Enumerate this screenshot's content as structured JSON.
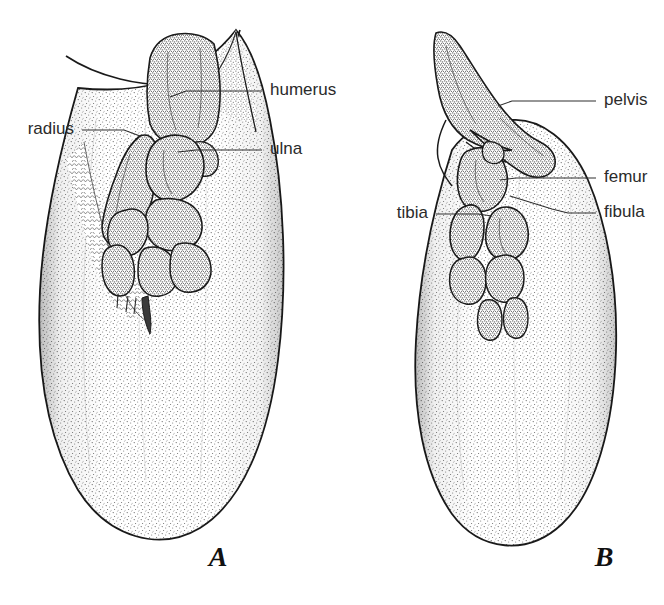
{
  "figure": {
    "background_color": "#ffffff",
    "ink_color": "#1a1a1a",
    "label_color": "#2b2b2b",
    "width": 664,
    "height": 605
  },
  "panels": [
    {
      "id": "A",
      "caption": "A",
      "caption_x": 218,
      "caption_y": 566,
      "description": "Front flipper with forelimb skeleton",
      "labels": [
        {
          "key": "humerus",
          "text": "humerus",
          "text_x": 270,
          "text_y": 91,
          "anchor": "start",
          "leader": "M 262 91 L 186 91 L 170 97"
        },
        {
          "key": "radius",
          "text": "radius",
          "text_x": 74,
          "text_y": 130,
          "anchor": "end",
          "leader": "M 82 130 L 124 130 L 140 136"
        },
        {
          "key": "ulna",
          "text": "ulna",
          "text_x": 270,
          "text_y": 150,
          "anchor": "start",
          "leader": "M 262 150 L 196 150 L 178 152"
        }
      ]
    },
    {
      "id": "B",
      "caption": "B",
      "caption_x": 604,
      "caption_y": 566,
      "description": "Hind flipper with hindlimb skeleton",
      "labels": [
        {
          "key": "pelvis",
          "text": "pelvis",
          "text_x": 604,
          "text_y": 101,
          "anchor": "start",
          "leader": "M 596 101 L 512 101 L 498 106"
        },
        {
          "key": "femur",
          "text": "femur",
          "text_x": 604,
          "text_y": 178,
          "anchor": "start",
          "leader": "M 596 178 L 516 178 L 500 180"
        },
        {
          "key": "fibula",
          "text": "fibula",
          "text_x": 604,
          "text_y": 213,
          "anchor": "start",
          "leader": "M 596 213 L 568 213 L 552 209 L 510 196"
        },
        {
          "key": "tibia",
          "text": "tibia",
          "text_x": 428,
          "text_y": 214,
          "anchor": "end",
          "leader": "M 436 214 L 478 214 L 492 216"
        }
      ]
    }
  ],
  "bone_names": [
    "humerus",
    "radius",
    "ulna",
    "pelvis",
    "femur",
    "fibula",
    "tibia"
  ],
  "style_notes": {
    "line_art": "pen-and-ink stipple",
    "stipple_density_paddle": "medium",
    "stipple_density_bone": "heavy"
  }
}
